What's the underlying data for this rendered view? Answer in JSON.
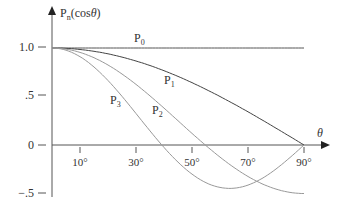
{
  "chart_data": {
    "type": "line",
    "title": "",
    "xlabel": "θ",
    "ylabel": "Pn(cosθ)",
    "ylabel_base": "P",
    "ylabel_sub": "n",
    "ylabel_arg": "(cos",
    "ylabel_theta": "θ",
    "ylabel_close": ")",
    "xlim": [
      0,
      90
    ],
    "ylim": [
      -0.5,
      1.0
    ],
    "x_ticks": [
      "10°",
      "30°",
      "50°",
      "70°",
      "90°"
    ],
    "x_tick_values": [
      10,
      30,
      50,
      70,
      90
    ],
    "y_ticks": [
      "1.0",
      ".5",
      "0",
      "−.5"
    ],
    "y_tick_values": [
      1.0,
      0.5,
      0,
      -0.5
    ],
    "grid": false,
    "legend_position": "inline labels",
    "series": [
      {
        "name": "P0",
        "label_base": "P",
        "label_sub": "0",
        "formula": "1",
        "x": [
          0,
          90
        ],
        "values": [
          1.0,
          1.0
        ],
        "color": "#555555"
      },
      {
        "name": "P1",
        "label_base": "P",
        "label_sub": "1",
        "formula": "cosθ",
        "x": [
          0,
          30,
          60,
          90
        ],
        "values": [
          1.0,
          0.866,
          0.5,
          0.0
        ],
        "color": "#444444"
      },
      {
        "name": "P2",
        "label_base": "P",
        "label_sub": "2",
        "formula": "(3cos²θ−1)/2",
        "x": [
          0,
          30,
          54.7,
          90
        ],
        "values": [
          1.0,
          0.625,
          0.0,
          -0.5
        ],
        "color": "#999999"
      },
      {
        "name": "P3",
        "label_base": "P",
        "label_sub": "3",
        "formula": "(5cos³θ−3cosθ)/2",
        "x": [
          0,
          30,
          39.2,
          63.4,
          90
        ],
        "values": [
          1.0,
          0.325,
          0.0,
          -0.447,
          0.0
        ],
        "color": "#999999"
      }
    ]
  }
}
